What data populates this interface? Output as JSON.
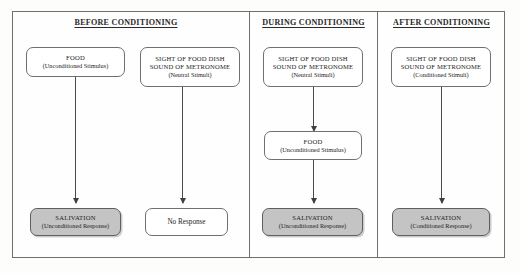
{
  "figure": {
    "panels": [
      {
        "id": "before",
        "title": "BEFORE CONDITIONING",
        "nodes": [
          {
            "id": "before-food",
            "shaded": false,
            "lines": [
              {
                "text": "FOOD",
                "style": "caps"
              },
              {
                "text": "(Unconditioned Stimulus)",
                "style": "paren"
              }
            ]
          },
          {
            "id": "before-neutral",
            "shaded": false,
            "lines": [
              {
                "text": "SIGHT OF FOOD DISH",
                "style": "caps"
              },
              {
                "text": "SOUND OF METRONOME",
                "style": "caps"
              },
              {
                "text": "(Neutral Stimuli)",
                "style": "paren"
              }
            ]
          },
          {
            "id": "before-salivation",
            "shaded": true,
            "lines": [
              {
                "text": "SALIVATION",
                "style": "caps"
              },
              {
                "text": "(Unconditioned Response)",
                "style": "paren"
              }
            ]
          },
          {
            "id": "before-no-response",
            "shaded": false,
            "lines": [
              {
                "text": "No Response",
                "style": "plain"
              }
            ]
          }
        ]
      },
      {
        "id": "during",
        "title": "DURING CONDITIONING",
        "nodes": [
          {
            "id": "during-neutral",
            "shaded": false,
            "lines": [
              {
                "text": "SIGHT OF FOOD DISH",
                "style": "caps"
              },
              {
                "text": "SOUND OF METRONOME",
                "style": "caps"
              },
              {
                "text": "(Neutral Stimuli)",
                "style": "paren"
              }
            ]
          },
          {
            "id": "during-food",
            "shaded": false,
            "lines": [
              {
                "text": "FOOD",
                "style": "caps"
              },
              {
                "text": "(Unconditioned Stimulus)",
                "style": "paren"
              }
            ]
          },
          {
            "id": "during-salivation",
            "shaded": true,
            "lines": [
              {
                "text": "SALIVATION",
                "style": "caps"
              },
              {
                "text": "(Unconditioned Response)",
                "style": "paren"
              }
            ]
          }
        ]
      },
      {
        "id": "after",
        "title": "AFTER  CONDITIONING",
        "nodes": [
          {
            "id": "after-conditioned",
            "shaded": false,
            "lines": [
              {
                "text": "SIGHT OF FOOD DISH",
                "style": "caps"
              },
              {
                "text": "SOUND OF METRONOME",
                "style": "caps"
              },
              {
                "text": "(Conditioned Stimuli)",
                "style": "paren"
              }
            ]
          },
          {
            "id": "after-salivation",
            "shaded": true,
            "lines": [
              {
                "text": "SALIVATION",
                "style": "caps"
              },
              {
                "text": "(Conditioned Response)",
                "style": "paren"
              }
            ]
          }
        ]
      }
    ],
    "colors": {
      "frame": "#6f6f6f",
      "box_border": "#707070",
      "shaded_fill": "#c4c4c4",
      "arrow": "#4a4a4a",
      "text": "#232323",
      "page": "#fdfdfc"
    }
  }
}
